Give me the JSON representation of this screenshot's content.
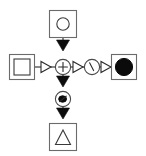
{
  "diagram": {
    "background_color": "#ffffff",
    "line_color": "#3a3a3a",
    "fill_color": "#0b0b0b",
    "width": 146,
    "height": 156,
    "nodes": [
      {
        "id": "top-node",
        "name": "square-with-open-circle",
        "shape": "square",
        "inner_glyph": "open-circle",
        "filled": false,
        "x": 63,
        "y": 24,
        "label": ""
      },
      {
        "id": "left-node",
        "name": "double-square",
        "shape": "square",
        "inner_glyph": "square",
        "filled": false,
        "x": 22,
        "y": 67,
        "label": ""
      },
      {
        "id": "center-node",
        "name": "circle-with-plus",
        "shape": "circle",
        "inner_glyph": "plus",
        "filled": false,
        "x": 63,
        "y": 67,
        "label": ""
      },
      {
        "id": "right-mid-node",
        "name": "circle-with-slash",
        "shape": "circle",
        "inner_glyph": "backslash",
        "filled": false,
        "x": 92,
        "y": 67,
        "label": ""
      },
      {
        "id": "right-node",
        "name": "square-with-filled-circle",
        "shape": "square",
        "inner_glyph": "filled-circle",
        "filled": true,
        "x": 124,
        "y": 67,
        "label": ""
      },
      {
        "id": "lower-node",
        "name": "circle-with-mark",
        "shape": "circle",
        "inner_glyph": "dark-mark",
        "filled": false,
        "x": 63,
        "y": 99,
        "label": ""
      },
      {
        "id": "bottom-node",
        "name": "square-with-triangle",
        "shape": "square",
        "inner_glyph": "triangle",
        "filled": false,
        "x": 63,
        "y": 137,
        "label": ""
      }
    ],
    "edges": [
      {
        "id": "edge-top-to-center",
        "name": "edge-top-to-center",
        "from": "top-node",
        "to": "center-node",
        "direction": "down",
        "arrow_style": "solid"
      },
      {
        "id": "edge-left-to-center",
        "name": "edge-left-to-center",
        "from": "left-node",
        "to": "center-node",
        "direction": "right",
        "arrow_style": "hollow"
      },
      {
        "id": "edge-center-to-right-mid",
        "name": "edge-center-to-right-mid",
        "from": "center-node",
        "to": "right-mid-node",
        "direction": "right",
        "arrow_style": "hollow"
      },
      {
        "id": "edge-right-mid-to-right",
        "name": "edge-right-mid-to-right",
        "from": "right-mid-node",
        "to": "right-node",
        "direction": "right",
        "arrow_style": "hollow"
      },
      {
        "id": "edge-center-to-lower",
        "name": "edge-center-to-lower",
        "from": "center-node",
        "to": "lower-node",
        "direction": "down",
        "arrow_style": "solid"
      },
      {
        "id": "edge-lower-to-bottom",
        "name": "edge-lower-to-bottom",
        "from": "lower-node",
        "to": "bottom-node",
        "direction": "down",
        "arrow_style": "solid"
      }
    ]
  }
}
